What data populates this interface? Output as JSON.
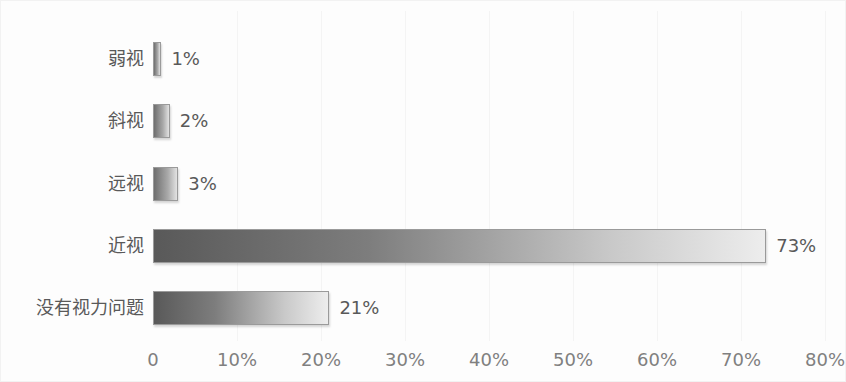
{
  "chart_data": {
    "type": "bar",
    "orientation": "horizontal",
    "title": "",
    "subtitle": "",
    "xlabel": "",
    "ylabel": "",
    "categories": [
      "弱视",
      "斜视",
      "远视",
      "近视",
      "没有视力问题"
    ],
    "values": [
      1,
      2,
      3,
      73,
      21
    ],
    "value_labels": [
      "1%",
      "2%",
      "3%",
      "73%",
      "21%"
    ],
    "xlim": [
      0,
      80
    ],
    "xticks": [
      0,
      10,
      20,
      30,
      40,
      50,
      60,
      70,
      80
    ],
    "xtick_labels": [
      "0",
      "10%",
      "20%",
      "30%",
      "40%",
      "50%",
      "60%",
      "70%",
      "80%"
    ],
    "grid": "vertical-faint",
    "legend": "none",
    "bar_fill": "gradient-dark-to-light-gray",
    "colors": {
      "bar_start": "#595959",
      "bar_end": "#ededed",
      "bar_border": "#9a9a9a",
      "text": "#595959",
      "axis_text": "#808080",
      "background": "#fdfdfd",
      "gridline": "#f4f4f4"
    }
  },
  "bars": [
    {
      "label": "弱视",
      "value": 1,
      "value_label": "1%",
      "top": 41,
      "height": 34
    },
    {
      "label": "斜视",
      "value": 2,
      "value_label": "2%",
      "top": 103,
      "height": 34
    },
    {
      "label": "远视",
      "value": 3,
      "value_label": "3%",
      "top": 166,
      "height": 34
    },
    {
      "label": "近视",
      "value": 73,
      "value_label": "73%",
      "top": 228,
      "height": 34
    },
    {
      "label": "没有视力问题",
      "value": 21,
      "value_label": "21%",
      "top": 290,
      "height": 34
    }
  ],
  "axis": {
    "ticks": [
      {
        "label": "0",
        "value": 0
      },
      {
        "label": "10%",
        "value": 10
      },
      {
        "label": "20%",
        "value": 20
      },
      {
        "label": "30%",
        "value": 30
      },
      {
        "label": "40%",
        "value": 40
      },
      {
        "label": "50%",
        "value": 50
      },
      {
        "label": "60%",
        "value": 60
      },
      {
        "label": "70%",
        "value": 70
      },
      {
        "label": "80%",
        "value": 80
      }
    ]
  }
}
